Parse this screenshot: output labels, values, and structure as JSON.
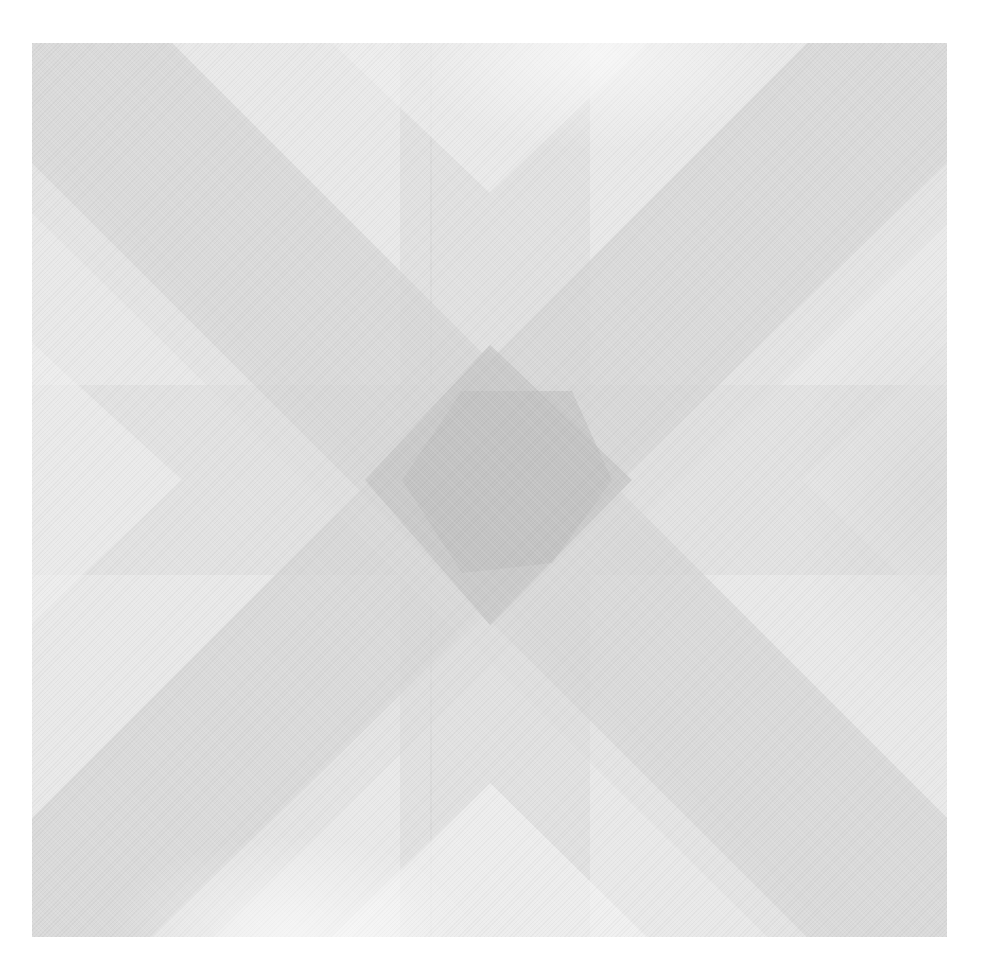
{
  "artwork": {
    "description": "Grayscale geometric print: two crossing diagonal bands forming an X, overlaid with faint horizontal and vertical bands; darkest square where all bands overlap at center",
    "colors": {
      "paper": "#ffffff",
      "background": "#ececec",
      "light_band": "#e2e2e2",
      "diagonal_band": "#d8d8d8",
      "overlap": "#cdcdcd",
      "center_square": "#bfbfbf"
    },
    "bounds": {
      "left": 32,
      "top": 43,
      "right": 947,
      "bottom": 937
    },
    "bands": {
      "vertical": {
        "x_from": 368,
        "x_to": 558
      },
      "horizontal": {
        "y_from": 342,
        "y_to": 532
      },
      "diagonal_width": 200
    }
  }
}
